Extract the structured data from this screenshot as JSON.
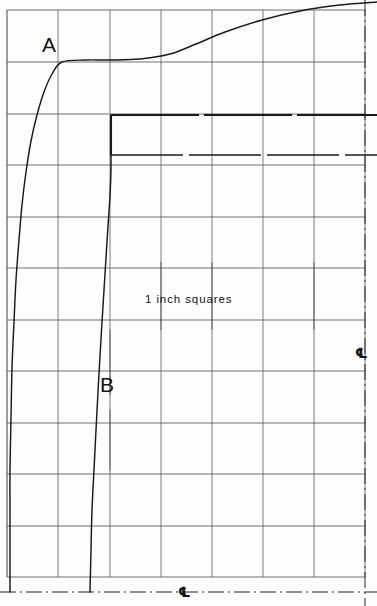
{
  "drawing": {
    "title": "Hull section profile grid",
    "background_color": "#fdfdfc",
    "line_color": "#1a1a1a",
    "grid_color": "#555555",
    "width": 377,
    "height": 606
  },
  "grid": {
    "note": "1 inch squares",
    "spacing_px": 51.4,
    "x_lines": [
      7,
      58,
      110,
      161,
      212,
      263,
      314,
      365
    ],
    "y_lines": [
      10,
      62,
      114,
      165,
      217,
      268,
      320,
      371,
      423,
      474,
      526,
      577
    ],
    "columns": 7,
    "rows": 11
  },
  "labels": {
    "curve_a": "A",
    "curve_b": "B",
    "grid_note": "1 inch squares",
    "centerline_symbol": "℄"
  },
  "annotations": [
    {
      "name": "label-a",
      "text": "A",
      "x": 42,
      "y": 52
    },
    {
      "name": "label-b",
      "text": "B",
      "x": 100,
      "y": 392
    },
    {
      "name": "grid-note",
      "text": "1 inch squares",
      "x": 145,
      "y": 303
    },
    {
      "name": "centerline-right",
      "text": "℄",
      "x": 355,
      "y": 358
    },
    {
      "name": "centerline-bottom",
      "text": "℄",
      "x": 178,
      "y": 597
    }
  ],
  "chart_data": {
    "type": "line",
    "title": "1 inch squares",
    "xlabel": "",
    "ylabel": "",
    "xlim": [
      7,
      377
    ],
    "ylim": [
      0,
      606
    ],
    "grid": true,
    "legend": "none",
    "series": [
      {
        "name": "A",
        "label": "A",
        "points": [
          [
            377,
            2
          ],
          [
            340,
            5
          ],
          [
            300,
            11
          ],
          [
            262,
            20
          ],
          [
            225,
            32
          ],
          [
            196,
            44
          ],
          [
            170,
            54
          ],
          [
            140,
            59
          ],
          [
            110,
            60
          ],
          [
            85,
            60
          ],
          [
            62,
            62
          ],
          [
            52,
            74
          ],
          [
            44,
            92
          ],
          [
            37,
            115
          ],
          [
            31,
            141
          ],
          [
            26,
            172
          ],
          [
            22,
            205
          ],
          [
            19,
            240
          ],
          [
            16,
            280
          ],
          [
            14,
            322
          ],
          [
            12,
            368
          ],
          [
            11,
            418
          ],
          [
            10,
            470
          ],
          [
            10,
            520
          ],
          [
            10,
            592
          ]
        ]
      },
      {
        "name": "B",
        "label": "B",
        "points": [
          [
            111,
            115
          ],
          [
            111,
            155
          ],
          [
            111,
            170
          ],
          [
            110,
            196
          ],
          [
            108,
            226
          ],
          [
            106,
            258
          ],
          [
            104,
            290
          ],
          [
            102,
            322
          ],
          [
            100,
            356
          ],
          [
            98,
            392
          ],
          [
            96,
            430
          ],
          [
            94,
            470
          ],
          [
            92,
            510
          ],
          [
            91,
            550
          ],
          [
            90,
            592
          ]
        ]
      }
    ],
    "step_profile": {
      "name": "step-outline",
      "vertical_x": 111,
      "top_y": 115,
      "mid_y": 155,
      "extends_to_x": 377
    }
  },
  "centerlines": [
    {
      "name": "right-vertical-centerline",
      "orientation": "vertical",
      "x": 365
    },
    {
      "name": "bottom-horizontal-centerline",
      "orientation": "horizontal",
      "y": 592
    }
  ],
  "tick_marks": {
    "description": "half-grid vertical tick segments",
    "items": [
      {
        "x": 110,
        "y1": 330,
        "y2": 395
      },
      {
        "x": 161,
        "y1": 262,
        "y2": 330
      },
      {
        "x": 212,
        "y1": 262,
        "y2": 330
      },
      {
        "x": 314,
        "y1": 262,
        "y2": 330
      },
      {
        "x": 110,
        "y1": 410,
        "y2": 470
      }
    ]
  }
}
